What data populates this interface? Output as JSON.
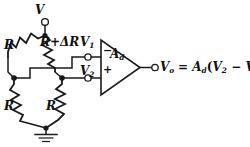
{
  "figure": {
    "background_color": "#ffffff",
    "ink_color": "#1a1a1a"
  },
  "source": {
    "label": "V",
    "terminal": "open-circle"
  },
  "bridge": {
    "resistors": [
      {
        "id": "top-left",
        "label_main": "R",
        "label_delta": ""
      },
      {
        "id": "top-right",
        "label_main": "R",
        "label_delta": "+ ΔR"
      },
      {
        "id": "bottom-left",
        "label_main": "R",
        "label_delta": ""
      },
      {
        "id": "bottom-right",
        "label_main": "R",
        "label_delta": ""
      }
    ],
    "top_left_label": "R",
    "top_right_label_r": "R",
    "top_right_label_op": "+",
    "top_right_label_dr": "ΔR",
    "bottom_left_label": "R",
    "bottom_right_label": "R",
    "ground": "ground-symbol"
  },
  "amplifier": {
    "gain_symbol": "A",
    "gain_subscript": "d",
    "inverting_mark": "−",
    "noninverting_mark": "+",
    "inverting_input_label": "V",
    "inverting_input_sub": "1",
    "noninverting_input_label": "V",
    "noninverting_input_sub": "2",
    "output_label": "V",
    "output_sub": "o"
  },
  "equation": {
    "equals": "=",
    "gain": "A",
    "gain_sub": "d",
    "open_paren": "(",
    "term1": "V",
    "term1_sub": "2",
    "minus": "−",
    "term2": "V",
    "term2_sub": "1",
    "close_paren": ")",
    "full_text": "Vₒ = Ad(V₂ − V₁)"
  },
  "terminals": {
    "source_terminal": "open-circle",
    "v1_terminal": "open-circle",
    "v2_terminal": "open-circle",
    "output_terminal": "open-circle",
    "junction_style": "filled-dot"
  }
}
